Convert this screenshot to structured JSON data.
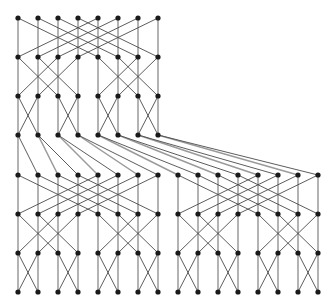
{
  "figure": {
    "type": "graph-diagram",
    "width": 334,
    "height": 302,
    "background_color": "#ffffff"
  },
  "style": {
    "node_color": "#1a1a1a",
    "node_radius": 2.6,
    "vertical_edge_color": "#9a9a9a",
    "vertical_edge_width": 1.5,
    "diagonal_edge_color": "#4a4a4a",
    "diagonal_edge_width": 0.9
  },
  "geometry": {
    "column_spacing": 20,
    "row_spacing": 39,
    "left_margin": 18,
    "top_margin": 18,
    "rows_y": [
      18,
      57,
      96,
      135,
      175,
      214,
      253,
      292
    ],
    "top_block_columns": 8,
    "bottom_block_columns": 16,
    "top_block_x": [
      18,
      38,
      58,
      78,
      98,
      118,
      138,
      158
    ],
    "bottom_block_x": [
      18,
      38,
      58,
      78,
      98,
      118,
      138,
      158,
      178,
      198,
      218,
      238,
      258,
      278,
      298,
      318
    ]
  },
  "chart_data": {
    "type": "graph",
    "node_rows": [
      {
        "row": 0,
        "y": 18,
        "count": 8,
        "x": [
          18,
          38,
          58,
          78,
          98,
          118,
          138,
          158
        ]
      },
      {
        "row": 1,
        "y": 57,
        "count": 8,
        "x": [
          18,
          38,
          58,
          78,
          98,
          118,
          138,
          158
        ]
      },
      {
        "row": 2,
        "y": 96,
        "count": 8,
        "x": [
          18,
          38,
          58,
          78,
          98,
          118,
          138,
          158
        ]
      },
      {
        "row": 3,
        "y": 135,
        "count": 8,
        "x": [
          18,
          38,
          58,
          78,
          98,
          118,
          138,
          158
        ]
      },
      {
        "row": 4,
        "y": 175,
        "count": 16,
        "x": [
          18,
          38,
          58,
          78,
          98,
          118,
          138,
          158,
          178,
          198,
          218,
          238,
          258,
          278,
          298,
          318
        ]
      },
      {
        "row": 5,
        "y": 214,
        "count": 16,
        "x": [
          18,
          38,
          58,
          78,
          98,
          118,
          138,
          158,
          178,
          198,
          218,
          238,
          258,
          278,
          298,
          318
        ]
      },
      {
        "row": 6,
        "y": 253,
        "count": 16,
        "x": [
          18,
          38,
          58,
          78,
          98,
          118,
          138,
          158,
          178,
          198,
          218,
          238,
          258,
          278,
          298,
          318
        ]
      },
      {
        "row": 7,
        "y": 292,
        "count": 16,
        "x": [
          18,
          38,
          58,
          78,
          98,
          118,
          138,
          158,
          178,
          198,
          218,
          238,
          258,
          278,
          298,
          318
        ]
      }
    ],
    "stages": [
      {
        "from_row": 0,
        "to_row": 1,
        "kind": "butterfly",
        "width": 8,
        "blocks": 1,
        "stride": 4
      },
      {
        "from_row": 1,
        "to_row": 2,
        "kind": "butterfly",
        "width": 8,
        "blocks": 1,
        "stride": 2
      },
      {
        "from_row": 2,
        "to_row": 3,
        "kind": "butterfly",
        "width": 8,
        "blocks": 1,
        "stride": 1
      },
      {
        "from_row": 3,
        "to_row": 4,
        "kind": "fanout",
        "width": 8,
        "blocks": 1,
        "stride": 0
      },
      {
        "from_row": 4,
        "to_row": 5,
        "kind": "butterfly",
        "width": 8,
        "blocks": 2,
        "stride": 4
      },
      {
        "from_row": 5,
        "to_row": 6,
        "kind": "butterfly",
        "width": 8,
        "blocks": 2,
        "stride": 2
      },
      {
        "from_row": 6,
        "to_row": 7,
        "kind": "butterfly",
        "width": 8,
        "blocks": 2,
        "stride": 1
      }
    ],
    "node_count_total": 96,
    "legend": [],
    "axis_labels": [],
    "annotations": []
  }
}
